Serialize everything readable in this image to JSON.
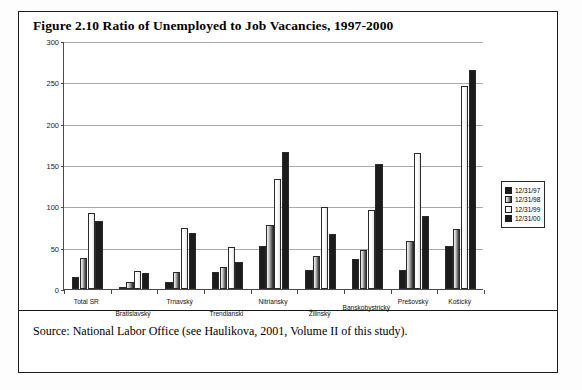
{
  "figure": {
    "title": "Figure 2.10  Ratio of Unemployed to Job Vacancies, 1997-2000",
    "source": "Source: National Labor Office (see Haulikova, 2001, Volume II of this study)."
  },
  "chart_data": {
    "type": "bar",
    "title": "Figure 2.10  Ratio of Unemployed to Job Vacancies, 1997-2000",
    "xlabel": "",
    "ylabel": "",
    "ylim": [
      0,
      300
    ],
    "yticks": [
      0,
      50,
      100,
      150,
      200,
      250,
      300
    ],
    "grid": true,
    "legend_position": "right",
    "categories": [
      "Total SR",
      "Bratislavský",
      "Trnavský",
      "Trendianski",
      "Nitriansky",
      "Žilinský",
      "Banskobystrický",
      "Prešovský",
      "Košický"
    ],
    "series": [
      {
        "name": "12/31/97",
        "color": "#1c1c1c",
        "values": [
          14,
          3,
          9,
          20,
          52,
          23,
          36,
          23,
          52
        ]
      },
      {
        "name": "12/31/98",
        "color": "#6d6d6d",
        "values": [
          38,
          9,
          21,
          27,
          78,
          40,
          47,
          58,
          72
        ]
      },
      {
        "name": "12/31/99",
        "color": "#f7f7f7",
        "values": [
          92,
          22,
          74,
          51,
          133,
          99,
          96,
          165,
          246
        ]
      },
      {
        "name": "12/31/00",
        "color": "#1c1c1c",
        "values": [
          82,
          19,
          68,
          33,
          166,
          67,
          151,
          88,
          265
        ]
      }
    ]
  }
}
